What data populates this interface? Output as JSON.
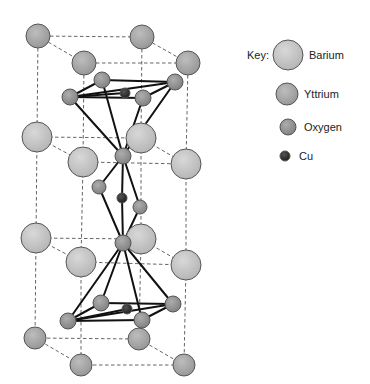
{
  "colors": {
    "barium": "#c6c6c6",
    "yttrium": "#a9a9a9",
    "oxygen": "#999999",
    "cu": "#2e2e2e",
    "outline": "#555555",
    "bond": "#111111",
    "dash": "#555555"
  },
  "key": {
    "title": "Key:",
    "items": [
      {
        "label": "Barium",
        "element": "barium",
        "cx": 288,
        "cy": 55,
        "r": 15,
        "lx": 309,
        "ly": 49
      },
      {
        "label": "Yttrium",
        "element": "yttrium",
        "cx": 287,
        "cy": 94,
        "r": 11,
        "lx": 304,
        "ly": 88
      },
      {
        "label": "Oxygen",
        "element": "oxygen",
        "cx": 288,
        "cy": 127,
        "r": 8,
        "lx": 304,
        "ly": 121
      },
      {
        "label": "Cu",
        "element": "cu",
        "cx": 285,
        "cy": 156,
        "r": 5,
        "lx": 299,
        "ly": 150
      }
    ]
  },
  "atoms": [
    {
      "id": "Y1",
      "element": "yttrium",
      "x": 38,
      "y": 36,
      "r": 12
    },
    {
      "id": "Y2",
      "element": "yttrium",
      "x": 142,
      "y": 37,
      "r": 12
    },
    {
      "id": "Y3",
      "element": "yttrium",
      "x": 84,
      "y": 63,
      "r": 12
    },
    {
      "id": "Y4",
      "element": "yttrium",
      "x": 188,
      "y": 63,
      "r": 12
    },
    {
      "id": "Ba1",
      "element": "barium",
      "x": 37,
      "y": 137,
      "r": 15
    },
    {
      "id": "Ba2",
      "element": "barium",
      "x": 141,
      "y": 138,
      "r": 15
    },
    {
      "id": "Ba3",
      "element": "barium",
      "x": 83,
      "y": 162,
      "r": 15
    },
    {
      "id": "Ba4",
      "element": "barium",
      "x": 186,
      "y": 164,
      "r": 15
    },
    {
      "id": "Ba5",
      "element": "barium",
      "x": 36,
      "y": 238,
      "r": 15
    },
    {
      "id": "Ba6",
      "element": "barium",
      "x": 141,
      "y": 239,
      "r": 15
    },
    {
      "id": "Ba7",
      "element": "barium",
      "x": 81,
      "y": 262,
      "r": 15
    },
    {
      "id": "Ba8",
      "element": "barium",
      "x": 186,
      "y": 265,
      "r": 15
    },
    {
      "id": "Y5",
      "element": "yttrium",
      "x": 35,
      "y": 338,
      "r": 11
    },
    {
      "id": "Y6",
      "element": "yttrium",
      "x": 139,
      "y": 339,
      "r": 11
    },
    {
      "id": "Y7",
      "element": "yttrium",
      "x": 81,
      "y": 365,
      "r": 11
    },
    {
      "id": "Y8",
      "element": "yttrium",
      "x": 184,
      "y": 365,
      "r": 11
    },
    {
      "id": "O1",
      "element": "oxygen",
      "x": 102,
      "y": 80,
      "r": 8
    },
    {
      "id": "O2",
      "element": "oxygen",
      "x": 175,
      "y": 82,
      "r": 8
    },
    {
      "id": "Cu1",
      "element": "cu",
      "x": 125,
      "y": 93,
      "r": 5
    },
    {
      "id": "O3",
      "element": "oxygen",
      "x": 70,
      "y": 97,
      "r": 8
    },
    {
      "id": "O4",
      "element": "oxygen",
      "x": 143,
      "y": 98,
      "r": 8
    },
    {
      "id": "O5",
      "element": "oxygen",
      "x": 123,
      "y": 156,
      "r": 8
    },
    {
      "id": "O6",
      "element": "oxygen",
      "x": 99,
      "y": 187,
      "r": 7
    },
    {
      "id": "Cu2",
      "element": "cu",
      "x": 122,
      "y": 198,
      "r": 5
    },
    {
      "id": "O7",
      "element": "oxygen",
      "x": 140,
      "y": 207,
      "r": 7
    },
    {
      "id": "O8",
      "element": "oxygen",
      "x": 123,
      "y": 243,
      "r": 8
    },
    {
      "id": "O9",
      "element": "oxygen",
      "x": 101,
      "y": 303,
      "r": 8
    },
    {
      "id": "O10",
      "element": "oxygen",
      "x": 173,
      "y": 304,
      "r": 8
    },
    {
      "id": "Cu3",
      "element": "cu",
      "x": 127,
      "y": 309,
      "r": 5
    },
    {
      "id": "O11",
      "element": "oxygen",
      "x": 68,
      "y": 321,
      "r": 8
    },
    {
      "id": "O12",
      "element": "oxygen",
      "x": 142,
      "y": 320,
      "r": 8
    }
  ],
  "dashed_edges": [
    [
      "Y1",
      "Y2"
    ],
    [
      "Y3",
      "Y4"
    ],
    [
      "Y1",
      "Y3"
    ],
    [
      "Y2",
      "Y4"
    ],
    [
      "Ba1",
      "Ba2"
    ],
    [
      "Ba3",
      "Ba4"
    ],
    [
      "Ba1",
      "Ba3"
    ],
    [
      "Ba2",
      "Ba4"
    ],
    [
      "Ba5",
      "Ba6"
    ],
    [
      "Ba7",
      "Ba8"
    ],
    [
      "Ba5",
      "Ba7"
    ],
    [
      "Ba6",
      "Ba8"
    ],
    [
      "Y5",
      "Y6"
    ],
    [
      "Y7",
      "Y8"
    ],
    [
      "Y5",
      "Y7"
    ],
    [
      "Y6",
      "Y8"
    ],
    [
      "Y1",
      "Ba1"
    ],
    [
      "Ba1",
      "Ba5"
    ],
    [
      "Ba5",
      "Y5"
    ],
    [
      "Y2",
      "Ba2"
    ],
    [
      "Ba2",
      "Ba6"
    ],
    [
      "Ba6",
      "Y6"
    ],
    [
      "Y3",
      "Ba3"
    ],
    [
      "Ba3",
      "Ba7"
    ],
    [
      "Ba7",
      "Y7"
    ],
    [
      "Y4",
      "Ba4"
    ],
    [
      "Ba4",
      "Ba8"
    ],
    [
      "Ba8",
      "Y8"
    ]
  ],
  "bonds": [
    [
      "O1",
      "O2"
    ],
    [
      "O3",
      "O4"
    ],
    [
      "O3",
      "O1"
    ],
    [
      "O4",
      "O2"
    ],
    [
      "O3",
      "O2"
    ],
    [
      "O3",
      "Cu1"
    ],
    [
      "O1",
      "O5"
    ],
    [
      "O2",
      "O5"
    ],
    [
      "O3",
      "O5"
    ],
    [
      "O4",
      "O5"
    ],
    [
      "O5",
      "O6"
    ],
    [
      "O6",
      "O8"
    ],
    [
      "O5",
      "O7"
    ],
    [
      "O7",
      "O8"
    ],
    [
      "O5",
      "Cu2"
    ],
    [
      "Cu2",
      "O8"
    ],
    [
      "O8",
      "O9"
    ],
    [
      "O8",
      "O10"
    ],
    [
      "O8",
      "O11"
    ],
    [
      "O8",
      "O12"
    ],
    [
      "O9",
      "O10"
    ],
    [
      "O11",
      "O12"
    ],
    [
      "O11",
      "O9"
    ],
    [
      "O12",
      "O10"
    ],
    [
      "O11",
      "O10"
    ],
    [
      "O11",
      "Cu3"
    ]
  ]
}
